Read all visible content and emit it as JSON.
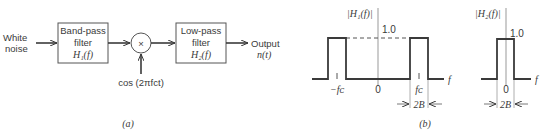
{
  "panel_a": {
    "input_label_line1": "White",
    "input_label_line2": "noise",
    "bandpass": {
      "line1": "Band-pass",
      "line2": "filter",
      "line3": "H₁(f)"
    },
    "multiplier_symbol": "×",
    "oscillator_label": "cos (2πfᴄt)",
    "lowpass": {
      "line1": "Low-pass",
      "line2": "filter",
      "line3": "H₂(f)"
    },
    "output_label_line1": "Output",
    "output_label_line2": "n(t)",
    "caption": "(a)"
  },
  "panel_b": {
    "h1": {
      "axis_label": "|H₁(f)|",
      "level_label": "1.0",
      "tick_neg": "−fᴄ",
      "tick_zero": "0",
      "tick_pos": "fᴄ",
      "f_label": "f",
      "bandwidth_label": "2B"
    },
    "h2": {
      "axis_label": "|H₂(f)|",
      "level_label": "1.0",
      "tick_zero": "0",
      "f_label": "f",
      "bandwidth_label": "2B"
    },
    "caption": "(b)"
  },
  "colors": {
    "stroke": "#3a3a3a",
    "axis": "#888888",
    "background": "#ffffff"
  }
}
